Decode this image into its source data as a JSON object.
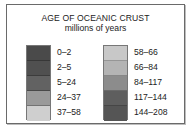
{
  "legend": {
    "title": "AGE OF OCEANIC CRUST",
    "subtitle": "millions of years",
    "left_column": [
      {
        "label": "0–2",
        "color": "#4a4a4a"
      },
      {
        "label": "2–5",
        "color": "#505050"
      },
      {
        "label": "5–24",
        "color": "#626262"
      },
      {
        "label": "24–37",
        "color": "#9a9a9a"
      },
      {
        "label": "37–58",
        "color": "#cfcfcf"
      }
    ],
    "right_column": [
      {
        "label": "58–66",
        "color": "#c8c8c8"
      },
      {
        "label": "66–84",
        "color": "#b4b4b4"
      },
      {
        "label": "84–117",
        "color": "#8c8c8c"
      },
      {
        "label": "117–144",
        "color": "#5e5e5e"
      },
      {
        "label": "144–208",
        "color": "#555555"
      }
    ]
  }
}
